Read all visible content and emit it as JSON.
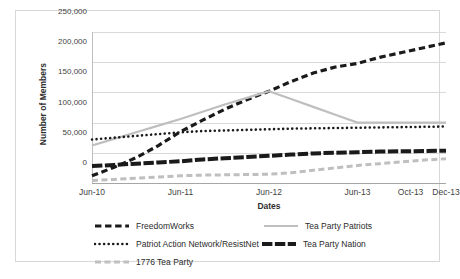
{
  "chart_data": {
    "type": "line",
    "title": "",
    "xlabel": "Dates",
    "ylabel": "Number of Members",
    "ylim": [
      0,
      250000
    ],
    "ytick_labels": [
      "250,000",
      "200,000",
      "150,000",
      "100,000",
      "50,000",
      "0"
    ],
    "ytick_values": [
      250000,
      200000,
      150000,
      100000,
      50000,
      0
    ],
    "xtick_labels": [
      "Jun-10",
      "Jun-11",
      "Jun-12",
      "Jun-13",
      "Oct-13",
      "Dec-13"
    ],
    "xtick_positions": [
      0,
      0.25,
      0.5,
      0.75,
      0.9,
      1.0
    ],
    "grid": true,
    "legend_position": "bottom",
    "x": [
      0,
      0.0625,
      0.125,
      0.1875,
      0.25,
      0.3125,
      0.375,
      0.4375,
      0.5,
      0.5625,
      0.625,
      0.6875,
      0.75,
      0.8125,
      0.875,
      0.9375,
      1.0
    ],
    "series": [
      {
        "name": "FreedomWorks",
        "color": "#1a1a1a",
        "style": "dashed",
        "width": 3.2,
        "values": [
          12000,
          26000,
          42000,
          62000,
          85000,
          104000,
          122000,
          138000,
          152000,
          168000,
          182000,
          192000,
          198000,
          208000,
          216000,
          224000,
          232000
        ]
      },
      {
        "name": "Tea Party Patriots",
        "color": "#bfbfbf",
        "style": "solid",
        "width": 2.2,
        "values": [
          62000,
          73000,
          84000,
          95000,
          106000,
          118000,
          130000,
          141000,
          152000,
          139000,
          126000,
          113000,
          100000,
          100000,
          100000,
          100000,
          100000
        ]
      },
      {
        "name": "Patriot Action Network/ResistNet",
        "color": "#1a1a1a",
        "style": "dotted",
        "width": 2.6,
        "values": [
          72000,
          75000,
          78000,
          81000,
          84000,
          86000,
          87000,
          88000,
          89000,
          90000,
          90500,
          91000,
          91500,
          92000,
          92500,
          93000,
          93500
        ]
      },
      {
        "name": "Tea Party Nation",
        "color": "#1a1a1a",
        "style": "thick-dash",
        "width": 4.0,
        "values": [
          28000,
          30000,
          32000,
          34000,
          36000,
          39000,
          41000,
          43000,
          45000,
          47000,
          49000,
          50000,
          51000,
          52000,
          52500,
          53000,
          53500
        ]
      },
      {
        "name": "1776 Tea Party",
        "color": "#bfbfbf",
        "style": "dashed",
        "width": 3.0,
        "values": [
          4000,
          6000,
          8000,
          10000,
          12000,
          13000,
          13500,
          14000,
          14500,
          17000,
          21000,
          25000,
          29000,
          32000,
          35000,
          38000,
          40000
        ]
      }
    ]
  },
  "legend": {
    "items": [
      {
        "label": "FreedomWorks",
        "key": "freedomworks"
      },
      {
        "label": "Tea Party Patriots",
        "key": "tea-party-patriots"
      },
      {
        "label": "Patriot Action Network/ResistNet",
        "key": "patriot-action-network"
      },
      {
        "label": "Tea Party Nation",
        "key": "tea-party-nation"
      },
      {
        "label": "1776 Tea Party",
        "key": "1776-tea-party"
      }
    ]
  },
  "axes": {
    "x_title": "Dates",
    "y_title": "Number of Members"
  }
}
